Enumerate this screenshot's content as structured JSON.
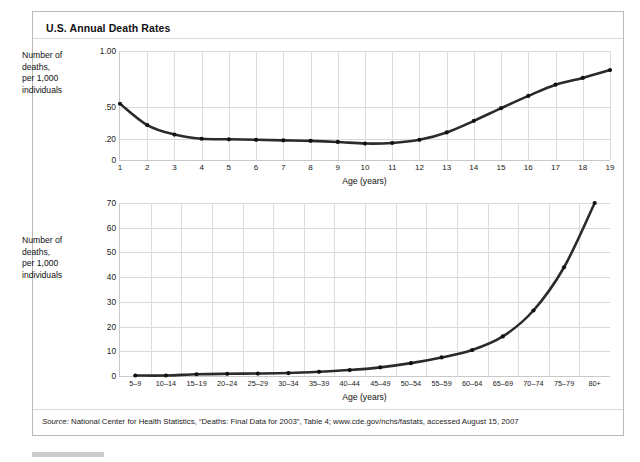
{
  "exhibit": {
    "title": "U.S. Annual Death Rates",
    "source_prefix": "Source:",
    "source_text": " National Center for Health Statistics, “Deaths: Final Data for 2003”, Table 4; www.cde.gov/nchs/fastats, accessed August 15, 2007"
  },
  "top_chart": {
    "y_caption": "Number of\ndeaths,\nper 1,000\nindividuals",
    "x_label": "Age (years)"
  },
  "bottom_chart": {
    "y_caption": "Number of\ndeaths,\nper 1,000\nindividuals",
    "x_label": "Age (years)"
  },
  "chart_data": [
    {
      "type": "line",
      "id": "death-rates-ages-1-19",
      "title": "U.S. Annual Death Rates",
      "xlabel": "Age (years)",
      "ylabel": "Number of deaths, per 1,000 individuals",
      "grid": true,
      "legend": "none",
      "x": [
        1,
        2,
        3,
        4,
        5,
        6,
        7,
        8,
        9,
        10,
        11,
        12,
        13,
        14,
        15,
        16,
        17,
        18,
        19
      ],
      "xticklabels": [
        "1",
        "2",
        "3",
        "4",
        "5",
        "6",
        "7",
        "8",
        "9",
        "10",
        "11",
        "12",
        "13",
        "14",
        "15",
        "16",
        "17",
        "18",
        "19"
      ],
      "values": [
        0.53,
        0.33,
        0.24,
        0.2,
        0.195,
        0.19,
        0.185,
        0.18,
        0.17,
        0.155,
        0.16,
        0.19,
        0.26,
        0.37,
        0.49,
        0.6,
        0.7,
        0.76,
        0.83
      ],
      "yticklabels": [
        "1.00",
        ".50",
        ".20",
        "0"
      ],
      "ytickvalues": [
        1.0,
        0.5,
        0.2,
        0
      ],
      "ytick_positions_pct": [
        0,
        51.5,
        80.5,
        100
      ],
      "ylim": [
        0,
        1.0
      ],
      "axis_scale": "nonlinear-compressed"
    },
    {
      "type": "line",
      "id": "death-rates-age-groups",
      "title": "U.S. Annual Death Rates",
      "xlabel": "Age (years)",
      "ylabel": "Number of deaths, per 1,000 individuals",
      "grid": true,
      "legend": "none",
      "categories": [
        "5–9",
        "10–14",
        "15–19",
        "20–24",
        "25–29",
        "30–34",
        "35–39",
        "40–44",
        "45–49",
        "50–54",
        "55–59",
        "60–64",
        "65–69",
        "70–74",
        "75–79",
        "80+"
      ],
      "values": [
        0.2,
        0.2,
        0.7,
        0.9,
        1.0,
        1.2,
        1.7,
        2.4,
        3.5,
        5.2,
        7.5,
        10.5,
        16.0,
        26.5,
        44.0,
        70.0
      ],
      "yticklabels": [
        "0",
        "10",
        "20",
        "30",
        "40",
        "50",
        "60",
        "70"
      ],
      "ytickvalues": [
        0,
        10,
        20,
        30,
        40,
        50,
        60,
        70
      ],
      "ylim": [
        0,
        70
      ]
    }
  ]
}
